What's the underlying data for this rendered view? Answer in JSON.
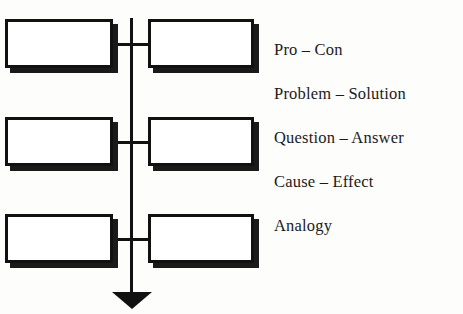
{
  "diagram": {
    "orientation": "vertical-spine-with-paired-boxes",
    "colors": {
      "background": "#fdfdfb",
      "stroke": "#111111",
      "box_fill": "#ffffff",
      "shadow": "#1a1a1a",
      "text": "#1b1b1b"
    },
    "spine": {
      "name": "vertical-flow-line",
      "arrow_direction": "down"
    },
    "rows": [
      {
        "left_box_text": "",
        "right_box_text": ""
      },
      {
        "left_box_text": "",
        "right_box_text": ""
      },
      {
        "left_box_text": "",
        "right_box_text": ""
      }
    ],
    "labels": [
      {
        "text": "Pro – Con"
      },
      {
        "text": "Problem – Solution"
      },
      {
        "text": "Question – Answer"
      },
      {
        "text": "Cause – Effect"
      },
      {
        "text": "Analogy"
      }
    ]
  }
}
